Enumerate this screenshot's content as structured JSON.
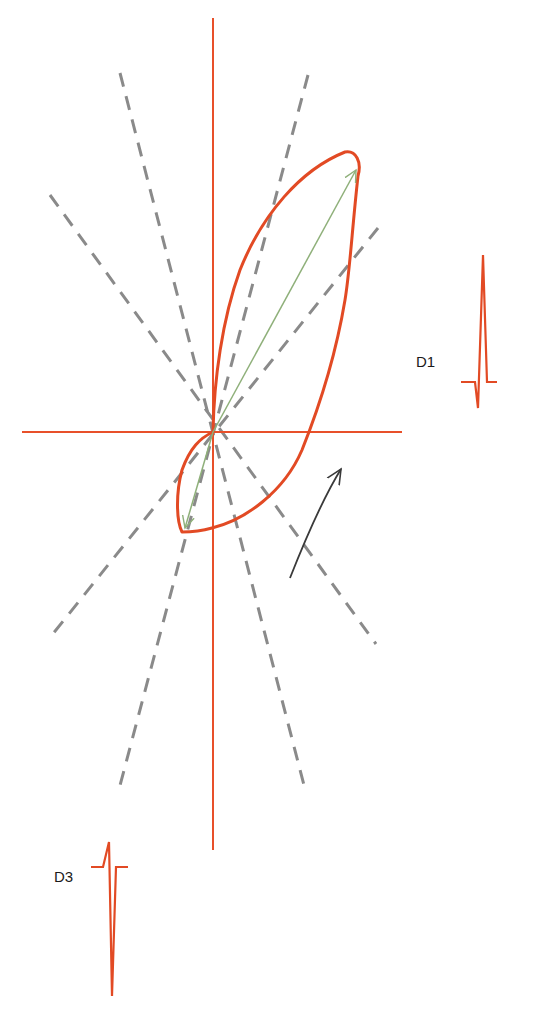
{
  "diagram": {
    "title": "",
    "colors": {
      "axis": "#e8502a",
      "loop": "#e24a24",
      "dashed": "#8a8a8a",
      "vector": "#8fb07a",
      "rotation_arrow": "#3a3a3a",
      "text": "#1a1a1a"
    },
    "center": [
      213,
      432
    ],
    "axes": {
      "vertical": {
        "x": 213,
        "y1": 18,
        "y2": 850
      },
      "horizontal": {
        "y": 432,
        "x1": 22,
        "x2": 402
      }
    },
    "dashed_lines": [
      {
        "from": [
          308,
          75
        ],
        "to": [
          118,
          793
        ]
      },
      {
        "from": [
          120,
          73
        ],
        "to": [
          306,
          793
        ]
      },
      {
        "from": [
          378,
          228
        ],
        "to": [
          48,
          640
        ]
      },
      {
        "from": [
          50,
          195
        ],
        "to": [
          376,
          644
        ]
      }
    ],
    "vectors": [
      {
        "name": "max-vector",
        "to": [
          356,
          170
        ]
      },
      {
        "name": "terminal-vector",
        "to": [
          185,
          528
        ]
      }
    ],
    "leads": [
      {
        "id": "lead-d1",
        "label": "D1",
        "label_pos": [
          416,
          362
        ]
      },
      {
        "id": "lead-d3",
        "label": "D3",
        "label_pos": [
          54,
          877
        ]
      }
    ],
    "rotation": "counterclockwise"
  }
}
